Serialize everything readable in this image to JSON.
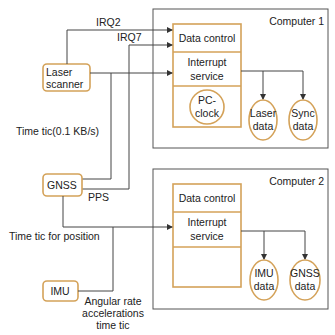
{
  "diagram": {
    "sources": {
      "laser_scanner": [
        "Laser",
        "scanner"
      ],
      "gnss": "GNSS",
      "imu": "IMU"
    },
    "signals": {
      "irq2": "IRQ2",
      "irq7": "IRQ7",
      "time_tic_laser": "Time tic(0.1 KB/s)",
      "pps": "PPS",
      "time_tic_position": "Time tic for position",
      "imu_output": [
        "Angular rate",
        "accelerations",
        "time tic"
      ]
    },
    "computer1": {
      "title": "Computer 1",
      "data_control": "Data control",
      "interrupt_service": [
        "Interrupt",
        "service"
      ],
      "clock": [
        "PC-",
        "clock"
      ],
      "outputs": [
        [
          "Laser",
          "data"
        ],
        [
          "Sync",
          "data"
        ]
      ]
    },
    "computer2": {
      "title": "Computer 2",
      "data_control": "Data control",
      "interrupt_service": [
        "Interrupt",
        "service"
      ],
      "outputs": [
        [
          "IMU",
          "data"
        ],
        [
          "GNSS",
          "data"
        ]
      ]
    },
    "colors": {
      "accent": "#d4a259",
      "line": "#444444",
      "frame": "#555555"
    }
  }
}
